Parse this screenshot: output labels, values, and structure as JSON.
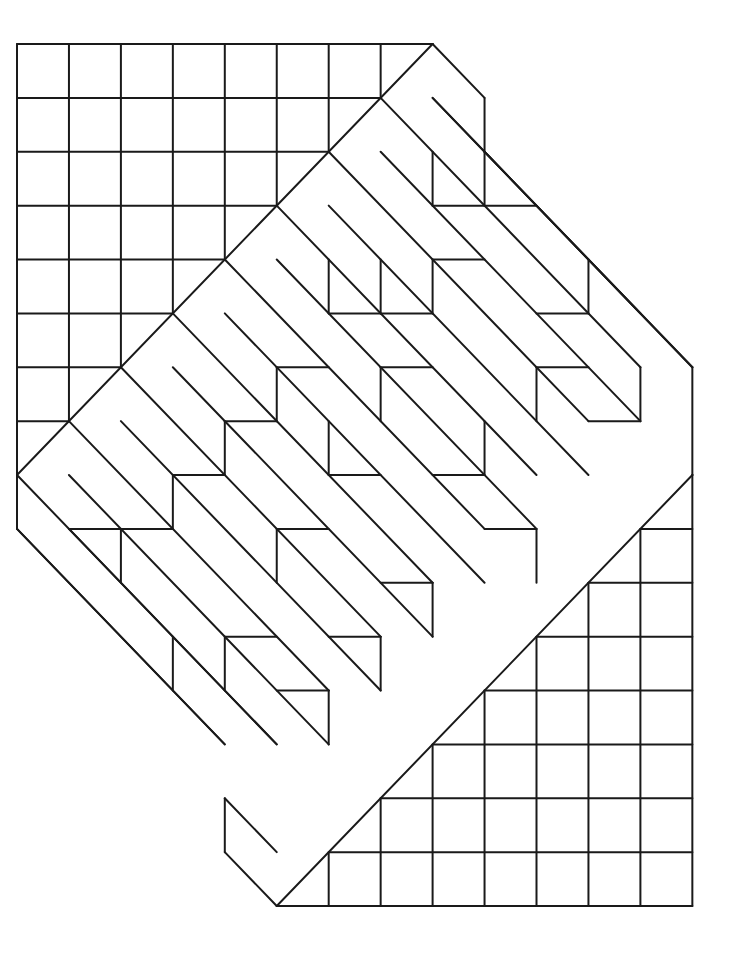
{
  "figure": {
    "stroke_color": "#1a1a1a",
    "background": "#ffffff",
    "lattice": {
      "origin_x": 17,
      "origin_y": 44,
      "cell_w": 51.95,
      "cell_h": 53.875
    },
    "upper_grid": {
      "rows": 8,
      "cols": 8,
      "diagonal": [
        [
          8,
          0
        ],
        [
          0,
          8
        ]
      ]
    },
    "lower_grid": {
      "diagonal": [
        [
          13,
          8
        ],
        [
          5,
          16
        ]
      ]
    },
    "outline": [
      [
        [
          8,
          0
        ],
        [
          9,
          1
        ]
      ],
      [
        [
          9,
          1
        ],
        [
          9,
          2
        ]
      ],
      [
        [
          8,
          1
        ],
        [
          9,
          2
        ]
      ],
      [
        [
          9,
          2
        ],
        [
          13,
          6
        ]
      ],
      [
        [
          13,
          6
        ],
        [
          13,
          8
        ]
      ],
      [
        [
          0,
          8
        ],
        [
          0,
          9
        ]
      ],
      [
        [
          0,
          9
        ],
        [
          4,
          13
        ]
      ],
      [
        [
          4,
          14
        ],
        [
          4,
          15
        ]
      ],
      [
        [
          4,
          14
        ],
        [
          5,
          15
        ]
      ],
      [
        [
          4,
          15
        ],
        [
          5,
          16
        ]
      ]
    ],
    "strips": [
      [
        [
          7,
          1
        ],
        [
          12,
          6
        ]
      ],
      [
        [
          7,
          2
        ],
        [
          12,
          7
        ]
      ],
      [
        [
          6,
          2
        ],
        [
          11,
          7
        ]
      ],
      [
        [
          6,
          3
        ],
        [
          11,
          8
        ]
      ],
      [
        [
          5,
          3
        ],
        [
          10,
          8
        ]
      ],
      [
        [
          5,
          4
        ],
        [
          10,
          9
        ]
      ],
      [
        [
          4,
          4
        ],
        [
          9,
          9
        ]
      ],
      [
        [
          4,
          5
        ],
        [
          9,
          10
        ]
      ],
      [
        [
          3,
          5
        ],
        [
          8,
          10
        ]
      ],
      [
        [
          3,
          6
        ],
        [
          8,
          11
        ]
      ],
      [
        [
          2,
          6
        ],
        [
          7,
          11
        ]
      ],
      [
        [
          2,
          7
        ],
        [
          7,
          12
        ]
      ],
      [
        [
          1,
          7
        ],
        [
          6,
          12
        ]
      ],
      [
        [
          1,
          8
        ],
        [
          6,
          13
        ]
      ],
      [
        [
          0,
          8
        ],
        [
          5,
          13
        ]
      ],
      [
        [
          9,
          2
        ],
        [
          13,
          6
        ]
      ],
      [
        [
          0,
          9
        ],
        [
          4,
          13
        ]
      ],
      [
        [
          8,
          1
        ],
        [
          12,
          5
        ]
      ],
      [
        [
          1,
          9
        ],
        [
          5,
          13
        ]
      ]
    ],
    "steps": [
      [
        [
          9,
          2
        ],
        [
          9,
          3
        ]
      ],
      [
        [
          9,
          3
        ],
        [
          10,
          3
        ]
      ],
      [
        [
          8,
          2
        ],
        [
          8,
          3
        ]
      ],
      [
        [
          8,
          3
        ],
        [
          9,
          3
        ]
      ],
      [
        [
          8,
          4
        ],
        [
          8,
          5
        ]
      ],
      [
        [
          8,
          4
        ],
        [
          9,
          4
        ]
      ],
      [
        [
          7,
          4
        ],
        [
          7,
          5
        ]
      ],
      [
        [
          7,
          5
        ],
        [
          8,
          5
        ]
      ],
      [
        [
          11,
          4
        ],
        [
          11,
          5
        ]
      ],
      [
        [
          10,
          5
        ],
        [
          11,
          5
        ]
      ],
      [
        [
          10,
          6
        ],
        [
          10,
          7
        ]
      ],
      [
        [
          10,
          6
        ],
        [
          11,
          6
        ]
      ],
      [
        [
          12,
          6
        ],
        [
          12,
          7
        ]
      ],
      [
        [
          11,
          7
        ],
        [
          12,
          7
        ]
      ],
      [
        [
          6,
          4
        ],
        [
          6,
          5
        ]
      ],
      [
        [
          6,
          5
        ],
        [
          7,
          5
        ]
      ],
      [
        [
          5,
          6
        ],
        [
          5,
          7
        ]
      ],
      [
        [
          5,
          6
        ],
        [
          6,
          6
        ]
      ],
      [
        [
          7,
          6
        ],
        [
          7,
          7
        ]
      ],
      [
        [
          7,
          6
        ],
        [
          8,
          6
        ]
      ],
      [
        [
          9,
          7
        ],
        [
          9,
          8
        ]
      ],
      [
        [
          8,
          8
        ],
        [
          9,
          8
        ]
      ],
      [
        [
          10,
          9
        ],
        [
          10,
          10
        ]
      ],
      [
        [
          9,
          9
        ],
        [
          10,
          9
        ]
      ],
      [
        [
          6,
          7
        ],
        [
          6,
          8
        ]
      ],
      [
        [
          6,
          8
        ],
        [
          7,
          8
        ]
      ],
      [
        [
          4,
          7
        ],
        [
          4,
          8
        ]
      ],
      [
        [
          4,
          7
        ],
        [
          5,
          7
        ]
      ],
      [
        [
          3,
          8
        ],
        [
          3,
          9
        ]
      ],
      [
        [
          3,
          8
        ],
        [
          4,
          8
        ]
      ],
      [
        [
          5,
          9
        ],
        [
          5,
          10
        ]
      ],
      [
        [
          5,
          9
        ],
        [
          6,
          9
        ]
      ],
      [
        [
          8,
          10
        ],
        [
          8,
          11
        ]
      ],
      [
        [
          7,
          10
        ],
        [
          8,
          10
        ]
      ],
      [
        [
          7,
          11
        ],
        [
          7,
          12
        ]
      ],
      [
        [
          6,
          11
        ],
        [
          7,
          11
        ]
      ],
      [
        [
          2,
          9
        ],
        [
          2,
          10
        ]
      ],
      [
        [
          2,
          9
        ],
        [
          3,
          9
        ]
      ],
      [
        [
          1,
          9
        ],
        [
          2,
          9
        ]
      ],
      [
        [
          4,
          11
        ],
        [
          4,
          12
        ]
      ],
      [
        [
          4,
          11
        ],
        [
          5,
          11
        ]
      ],
      [
        [
          6,
          12
        ],
        [
          6,
          13
        ]
      ],
      [
        [
          5,
          12
        ],
        [
          6,
          12
        ]
      ],
      [
        [
          3,
          11
        ],
        [
          3,
          12
        ]
      ]
    ]
  }
}
